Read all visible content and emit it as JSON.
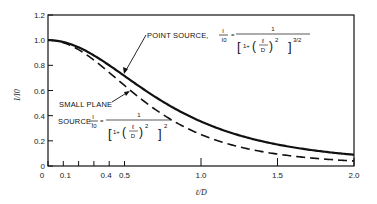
{
  "chart_data": {
    "type": "line",
    "title": "",
    "xlabel": "ℓ/D",
    "ylabel": "I/I0",
    "xlim": [
      0,
      2.0
    ],
    "ylim": [
      0,
      1.2
    ],
    "grid": false,
    "x_tick_labels": [
      "0",
      "0.1",
      "0.4",
      "0.5",
      "1.0",
      "1.5",
      "2.0"
    ],
    "x_ticks": [
      0,
      0.1,
      0.2,
      0.3,
      0.4,
      0.5,
      1.0,
      1.5,
      2.0
    ],
    "y_tick_labels": [
      "0",
      "0.2",
      "0.4",
      "0.6",
      "0.8",
      "1.0",
      "1.2"
    ],
    "y_ticks": [
      0,
      0.2,
      0.4,
      0.6,
      0.8,
      1.0,
      1.2
    ],
    "x": [
      0,
      0.1,
      0.2,
      0.3,
      0.4,
      0.5,
      0.6,
      0.7,
      0.8,
      0.9,
      1.0,
      1.1,
      1.2,
      1.3,
      1.4,
      1.5,
      1.6,
      1.7,
      1.8,
      1.9,
      2.0
    ],
    "series": [
      {
        "name": "Point source",
        "style": "solid",
        "formula": "I/I0 = 1 / [1 + (ℓ/D)^2]^(3/2)",
        "values": [
          1.0,
          0.985,
          0.943,
          0.879,
          0.8,
          0.716,
          0.631,
          0.552,
          0.476,
          0.411,
          0.354,
          0.305,
          0.263,
          0.228,
          0.198,
          0.171,
          0.149,
          0.131,
          0.115,
          0.101,
          0.089
        ]
      },
      {
        "name": "Small plane source",
        "style": "dashed",
        "formula": "I/I0 = 1 / [1 + (ℓ/D)^2]^2",
        "values": [
          1.0,
          0.98,
          0.925,
          0.842,
          0.743,
          0.64,
          0.541,
          0.45,
          0.372,
          0.305,
          0.25,
          0.205,
          0.168,
          0.138,
          0.114,
          0.095,
          0.079,
          0.066,
          0.056,
          0.048,
          0.04
        ]
      }
    ],
    "annotations": [
      {
        "text": "POINT SOURCE, I/I0 = 1 / [1+(ℓ/D)^2]^3/2",
        "target_series": "Point source"
      },
      {
        "text": "SMALL PLANE SOURCE, I/I0 = 1 / [1+(ℓ/D)^2]^2",
        "target_series": "Small plane source"
      }
    ]
  },
  "labels": {
    "y_axis": "I/I0",
    "y_axis_num": "I",
    "y_axis_den": "I0",
    "x_axis": "ℓ/D",
    "point_source_line1": "POINT SOURCE,",
    "small_plane_line1": "SMALL PLANE",
    "small_plane_line2": "SOURCE,",
    "frac_num": "I",
    "frac_den": "I0",
    "eq": "=",
    "one": "1",
    "one_plus": "1+",
    "ell": "ℓ",
    "d": "D",
    "exp_point": "3/2",
    "exp_plane": "2",
    "sq": "2"
  }
}
